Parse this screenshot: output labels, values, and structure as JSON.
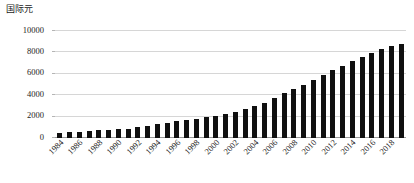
{
  "chart_data": {
    "type": "bar",
    "title": "",
    "ylabel": "国际元",
    "xlabel": "",
    "ylim": [
      0,
      10000
    ],
    "yticks": [
      0,
      2000,
      4000,
      6000,
      8000,
      10000
    ],
    "ytick_labels": [
      "0",
      "2000",
      "4000",
      "6000",
      "8000",
      "10000"
    ],
    "grid": true,
    "legend": null,
    "bar_color": "#101010",
    "grid_color": "#d6d6d6",
    "axis_color": "#9a9a9a",
    "xtick_step": 2,
    "xtick_rotation": -45,
    "categories": [
      "1984",
      "1985",
      "1986",
      "1987",
      "1988",
      "1989",
      "1990",
      "1991",
      "1992",
      "1993",
      "1994",
      "1995",
      "1996",
      "1997",
      "1998",
      "1999",
      "2000",
      "2001",
      "2002",
      "2003",
      "2004",
      "2005",
      "2006",
      "2007",
      "2008",
      "2009",
      "2010",
      "2011",
      "2012",
      "2013",
      "2014",
      "2015",
      "2016",
      "2017",
      "2018",
      "2019"
    ],
    "xtick_labels": [
      "1984",
      "1986",
      "1988",
      "1990",
      "1992",
      "1994",
      "1996",
      "1998",
      "2000",
      "2002",
      "2004",
      "2006",
      "2008",
      "2010",
      "2012",
      "2014",
      "2016",
      "2018"
    ],
    "values": [
      480,
      520,
      580,
      650,
      720,
      760,
      800,
      880,
      1000,
      1130,
      1280,
      1420,
      1570,
      1700,
      1820,
      1950,
      2100,
      2280,
      2480,
      2720,
      3000,
      3320,
      3720,
      4180,
      4560,
      4950,
      5430,
      5930,
      6330,
      6760,
      7180,
      7540,
      7930,
      8340,
      8620,
      8780
    ]
  }
}
